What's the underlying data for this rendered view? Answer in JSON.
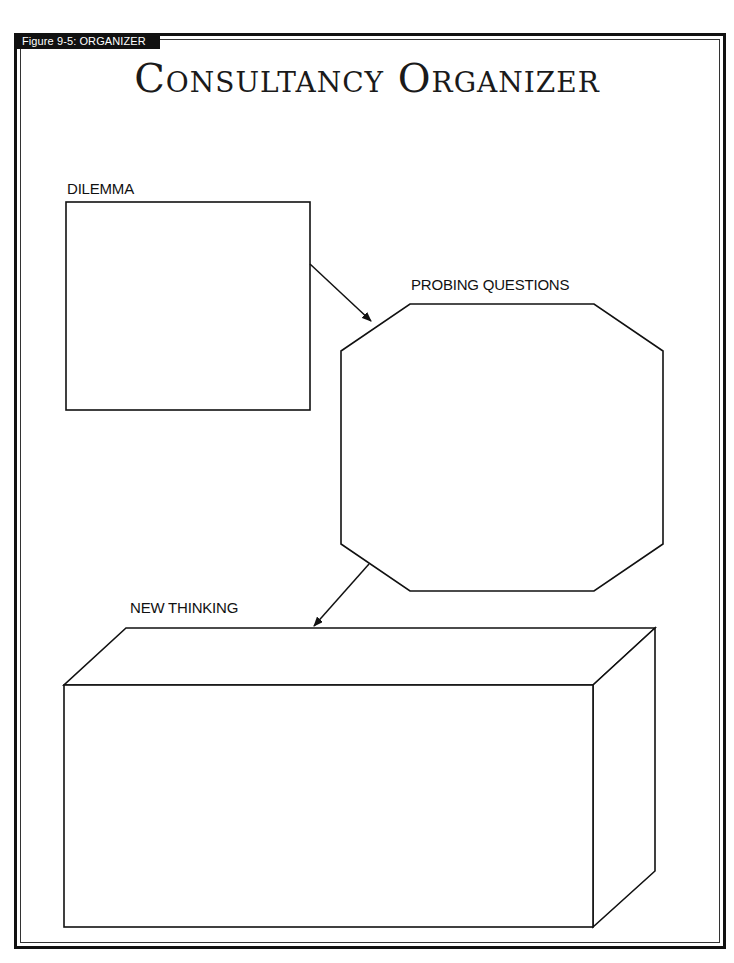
{
  "figure_label": "Figure 9-5: ORGANIZER",
  "title": "Consultancy Organizer",
  "sections": {
    "dilemma": {
      "label": "DILEMMA",
      "shape": "rectangle"
    },
    "probing_questions": {
      "label": "PROBING QUESTIONS",
      "shape": "octagon"
    },
    "new_thinking": {
      "label": "NEW THINKING",
      "shape": "3d-box"
    }
  },
  "arrows": [
    {
      "from": "dilemma",
      "to": "probing_questions"
    },
    {
      "from": "probing_questions",
      "to": "new_thinking"
    }
  ],
  "colors": {
    "ink": "#111111",
    "paper": "#ffffff",
    "label_bg": "#111111",
    "label_text": "#ffffff"
  }
}
